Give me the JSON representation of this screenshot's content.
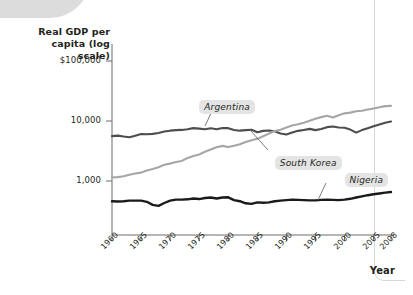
{
  "chart_data": {
    "type": "line",
    "title": "",
    "subtitle": "",
    "ylabel": "Real GDP per capita (log scale)",
    "xlabel": "Year",
    "log_scale": true,
    "grid": false,
    "legend_position": "inline-annotations",
    "ytick_labels": [
      "$100,000",
      "10,000",
      "1,000"
    ],
    "ytick_values": [
      100000,
      10000,
      1000
    ],
    "ylim": [
      300,
      200000
    ],
    "xtick_labels": [
      "1960",
      "1965",
      "1970",
      "1975",
      "1980",
      "1985",
      "1990",
      "1995",
      "2000",
      "2005",
      "2008"
    ],
    "xtick_values": [
      1960,
      1965,
      1970,
      1975,
      1980,
      1985,
      1990,
      1995,
      2000,
      2005,
      2008
    ],
    "xlim": [
      1960,
      2008
    ],
    "series": [
      {
        "name": "Argentina",
        "color": "#4d4d4d",
        "x": [
          1960,
          1961,
          1962,
          1963,
          1964,
          1965,
          1966,
          1967,
          1968,
          1969,
          1970,
          1971,
          1972,
          1973,
          1974,
          1975,
          1976,
          1977,
          1978,
          1979,
          1980,
          1981,
          1982,
          1983,
          1984,
          1985,
          1986,
          1987,
          1988,
          1989,
          1990,
          1991,
          1992,
          1993,
          1994,
          1995,
          1996,
          1997,
          1998,
          1999,
          2000,
          2001,
          2002,
          2003,
          2004,
          2005,
          2006,
          2007,
          2008
        ],
        "values": [
          5600,
          5700,
          5500,
          5350,
          5700,
          6050,
          6000,
          6100,
          6300,
          6700,
          6900,
          7050,
          7100,
          7300,
          7600,
          7450,
          7300,
          7550,
          7300,
          7650,
          7600,
          7100,
          6900,
          7050,
          7150,
          6500,
          6850,
          6950,
          6750,
          6200,
          5950,
          6450,
          6850,
          7100,
          7400,
          7050,
          7350,
          7900,
          8100,
          7800,
          7700,
          7200,
          6400,
          7050,
          7600,
          8150,
          8750,
          9350,
          9800
        ]
      },
      {
        "name": "South Korea",
        "color": "#a6a6a6",
        "x": [
          1960,
          1961,
          1962,
          1963,
          1964,
          1965,
          1966,
          1967,
          1968,
          1969,
          1970,
          1971,
          1972,
          1973,
          1974,
          1975,
          1976,
          1977,
          1978,
          1979,
          1980,
          1981,
          1982,
          1983,
          1984,
          1985,
          1986,
          1987,
          1988,
          1989,
          1990,
          1991,
          1992,
          1993,
          1994,
          1995,
          1996,
          1997,
          1998,
          1999,
          2000,
          2001,
          2002,
          2003,
          2004,
          2005,
          2006,
          2007,
          2008
        ],
        "values": [
          1150,
          1160,
          1200,
          1270,
          1330,
          1380,
          1500,
          1580,
          1700,
          1860,
          1950,
          2070,
          2160,
          2420,
          2610,
          2760,
          3070,
          3350,
          3640,
          3850,
          3700,
          3880,
          4090,
          4470,
          4760,
          5040,
          5570,
          6170,
          6790,
          7170,
          7800,
          8430,
          8830,
          9350,
          10100,
          10900,
          11600,
          12200,
          11400,
          12500,
          13400,
          13800,
          14500,
          14800,
          15500,
          16200,
          17000,
          17700,
          17900
        ]
      },
      {
        "name": "Nigeria",
        "color": "#1a1a1a",
        "x": [
          1960,
          1961,
          1962,
          1963,
          1964,
          1965,
          1966,
          1967,
          1968,
          1969,
          1970,
          1971,
          1972,
          1973,
          1974,
          1975,
          1976,
          1977,
          1978,
          1979,
          1980,
          1981,
          1982,
          1983,
          1984,
          1985,
          1986,
          1987,
          1988,
          1989,
          1990,
          1991,
          1992,
          1993,
          1994,
          1995,
          1996,
          1997,
          1998,
          1999,
          2000,
          2001,
          2002,
          2003,
          2004,
          2005,
          2006,
          2007,
          2008
        ],
        "values": [
          460,
          455,
          460,
          470,
          470,
          470,
          450,
          400,
          385,
          430,
          470,
          490,
          490,
          495,
          510,
          500,
          520,
          530,
          510,
          530,
          535,
          480,
          460,
          425,
          415,
          440,
          435,
          440,
          460,
          470,
          480,
          490,
          485,
          480,
          475,
          475,
          485,
          490,
          485,
          480,
          490,
          505,
          530,
          555,
          580,
          600,
          620,
          640,
          655
        ]
      }
    ],
    "annotations": [
      {
        "label": "Argentina",
        "x": 1975,
        "y": 22000
      },
      {
        "label": "South Korea",
        "x": 1988,
        "y": 2600
      },
      {
        "label": "Nigeria",
        "x": 2000,
        "y": 1350
      }
    ]
  },
  "axes": {
    "y_title_line1": "Real GDP per",
    "y_title_line2": "capita (log scale)",
    "x_title": "Year"
  },
  "colors": {
    "argentina": "#4d4d4d",
    "south_korea": "#a6a6a6",
    "nigeria": "#1a1a1a",
    "axis": "#6d6d6d",
    "text": "#231f20",
    "label_box": "#e4e4e4",
    "header_band": "#dcdcdc"
  }
}
